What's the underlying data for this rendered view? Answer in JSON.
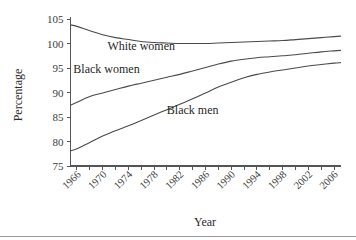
{
  "chart_data": {
    "type": "line",
    "title": "",
    "xlabel": "Year",
    "ylabel": "Percentage",
    "xlim": [
      1965,
      2007
    ],
    "ylim": [
      75,
      105
    ],
    "grid": false,
    "legend": "inline-labels",
    "yticks": [
      75,
      80,
      85,
      90,
      95,
      100,
      105
    ],
    "xticks": [
      1966,
      1970,
      1974,
      1978,
      1982,
      1986,
      1990,
      1994,
      1998,
      2002,
      2006
    ],
    "x": [
      1965,
      1966,
      1968,
      1970,
      1972,
      1974,
      1976,
      1978,
      1980,
      1982,
      1984,
      1986,
      1988,
      1990,
      1992,
      1994,
      1996,
      1998,
      2000,
      2002,
      2004,
      2006,
      2007
    ],
    "series": [
      {
        "name": "White women",
        "label": "White women",
        "values": [
          103.8,
          103.5,
          102.6,
          101.8,
          101.2,
          100.8,
          100.4,
          100.2,
          100.1,
          100.0,
          100.0,
          100.0,
          100.1,
          100.2,
          100.3,
          100.4,
          100.5,
          100.6,
          100.8,
          101.0,
          101.2,
          101.4,
          101.5
        ]
      },
      {
        "name": "Black women",
        "label": "Black women",
        "values": [
          87.4,
          88.0,
          89.2,
          89.9,
          90.6,
          91.3,
          91.9,
          92.5,
          93.1,
          93.7,
          94.4,
          95.1,
          95.8,
          96.4,
          96.8,
          97.1,
          97.3,
          97.5,
          97.7,
          98.0,
          98.3,
          98.5,
          98.6
        ]
      },
      {
        "name": "Black men",
        "label": "Black men",
        "values": [
          78.1,
          78.5,
          79.8,
          81.1,
          82.2,
          83.2,
          84.3,
          85.4,
          86.5,
          87.6,
          88.7,
          89.9,
          91.1,
          92.1,
          93.0,
          93.7,
          94.2,
          94.6,
          95.0,
          95.4,
          95.7,
          96.0,
          96.1
        ]
      }
    ],
    "annotations": [
      {
        "text": "White women",
        "x": 1976.0,
        "y": 98.6
      },
      {
        "text": "Black women",
        "x": 1970.6,
        "y": 94.0
      },
      {
        "text": "Black men",
        "x": 1984.0,
        "y": 85.6
      }
    ]
  }
}
